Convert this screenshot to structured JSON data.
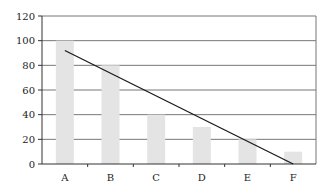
{
  "chart_data": {
    "type": "bar",
    "title": "",
    "xlabel": "",
    "ylabel": "",
    "categories": [
      "A",
      "B",
      "C",
      "D",
      "E",
      "F"
    ],
    "series": [
      {
        "name": "bars",
        "values": [
          100,
          80,
          40,
          30,
          20,
          10
        ]
      }
    ],
    "trendline": {
      "type": "line",
      "start": {
        "category": "A",
        "value": 92
      },
      "end": {
        "category": "F",
        "value": 0
      }
    },
    "ylim": [
      0,
      120
    ],
    "yticks": [
      0,
      20,
      40,
      60,
      80,
      100,
      120
    ],
    "grid": true,
    "legend": "none",
    "colors": {
      "bar": "#e4e4e4",
      "trendline": "#1a1a1a",
      "grid": "#777777",
      "axis": "#333333"
    }
  }
}
